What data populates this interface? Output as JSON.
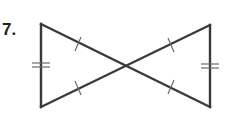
{
  "problem": {
    "number_label": "7.",
    "figure": {
      "description": "Two triangles meeting at a common vertex (bowtie) with congruence tick marks",
      "left_triangle": {
        "vertices": [
          [
            41,
            24
          ],
          [
            41,
            107
          ],
          [
            126,
            66
          ]
        ]
      },
      "right_triangle": {
        "vertices": [
          [
            210,
            25
          ],
          [
            210,
            107
          ],
          [
            126,
            66
          ]
        ]
      },
      "marks": {
        "single_ticks": 4,
        "double_ticks": 2
      },
      "stroke_color": "#3a3a3a",
      "tick_color": "#6a6a6a"
    }
  }
}
